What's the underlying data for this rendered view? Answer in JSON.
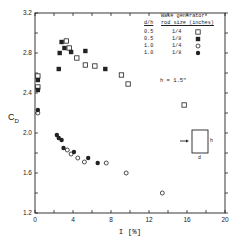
{
  "chart_data": {
    "type": "scatter",
    "title": "",
    "xlabel": "I [%]",
    "ylabel": "C_D",
    "xlim": [
      0,
      20
    ],
    "ylim": [
      1.2,
      3.2
    ],
    "x_ticks": [
      0,
      4,
      8,
      12,
      16,
      20
    ],
    "y_ticks": [
      1.2,
      1.6,
      2.0,
      2.4,
      2.8,
      3.2
    ],
    "grid": false,
    "legend_position": "upper right",
    "legend_header": {
      "col1": "d/h",
      "col2_line1": "Wake generator",
      "col2_line2": "rod size (inches)"
    },
    "annotation": "h = 1.5\"",
    "inset": {
      "arrow": "flow direction",
      "label_h": "h",
      "label_d": "d"
    },
    "series": [
      {
        "name": "d/h 0.5, rod 1/4",
        "dh": "0.5",
        "rod": "1/4",
        "marker": "open-square",
        "x": [
          0.3,
          0.3,
          3.3,
          3.6,
          4.4,
          5.3,
          6.3,
          9.1,
          9.8,
          15.7
        ],
        "y": [
          2.57,
          2.46,
          2.92,
          2.85,
          2.75,
          2.68,
          2.67,
          2.58,
          2.49,
          2.28
        ]
      },
      {
        "name": "d/h 0.5, rod 1/8",
        "dh": "0.5",
        "rod": "1/8",
        "marker": "filled-square",
        "x": [
          0.3,
          0.3,
          2.8,
          3.1,
          2.6,
          3.8,
          5.3,
          2.5,
          7.4
        ],
        "y": [
          2.53,
          2.43,
          2.91,
          2.85,
          2.8,
          2.81,
          2.82,
          2.64,
          2.64
        ]
      },
      {
        "name": "d/h 1.0, rod 1/4",
        "dh": "1.0",
        "rod": "1/4",
        "marker": "open-circle",
        "x": [
          0.3,
          3.4,
          3.8,
          4.5,
          5.2,
          7.5,
          9.6,
          13.4
        ],
        "y": [
          2.2,
          1.83,
          1.79,
          1.75,
          1.71,
          1.7,
          1.6,
          1.4
        ]
      },
      {
        "name": "d/h 1.0, rod 1/8",
        "dh": "1.0",
        "rod": "1/8",
        "marker": "filled-circle",
        "x": [
          0.3,
          2.3,
          2.5,
          2.8,
          3.0,
          4.1,
          5.6,
          6.6
        ],
        "y": [
          2.23,
          1.98,
          1.95,
          1.93,
          1.85,
          1.81,
          1.75,
          1.7
        ]
      }
    ]
  },
  "legend": {
    "header1": "Wake generator",
    "header2_dh": "d/h",
    "header2_rod": "rod size (inches)",
    "rows": [
      {
        "dh": "0.5",
        "rod": "1/4"
      },
      {
        "dh": "0.5",
        "rod": "1/8"
      },
      {
        "dh": "1.0",
        "rod": "1/4"
      },
      {
        "dh": "1.0",
        "rod": "1/8"
      }
    ]
  },
  "annotation": "h = 1.5\"",
  "axis": {
    "ylabel": "C",
    "ylabel_sub": "D",
    "xlabel": "I  [%]"
  }
}
